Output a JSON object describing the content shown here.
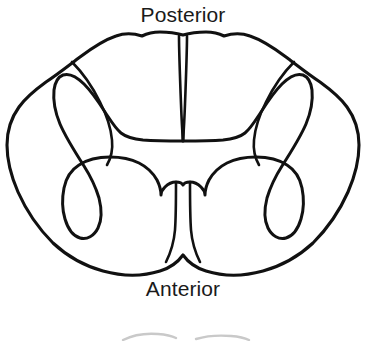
{
  "figure": {
    "name": "spinal-cord-cross-section",
    "background_color": "#ffffff",
    "stroke_color": "#111111",
    "label_color": "#1a1a1a",
    "width": 366,
    "height": 341
  },
  "labels": {
    "posterior": "Posterior",
    "anterior": "Anterior"
  },
  "structures": {
    "outer_boundary": "white-matter-outline",
    "gray_matter": "gray-matter-butterfly",
    "posterior_median_sulcus": "posterior-median-sulcus",
    "anterior_median_fissure": "anterior-median-fissure",
    "posterior_intermediate_sulcus_left": "posterior-intermediate-sulcus-left",
    "posterior_intermediate_sulcus_right": "posterior-intermediate-sulcus-right",
    "posterior_gray_commissure": "posterior-gray-commissure"
  },
  "partial_next_figure": {
    "visible": true,
    "description": "faint cropped top edge of a second figure"
  }
}
